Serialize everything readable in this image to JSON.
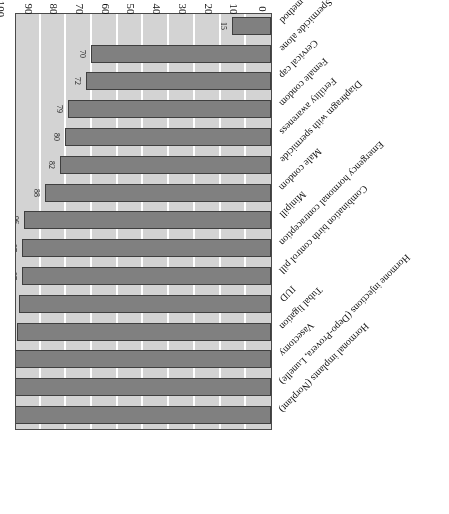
{
  "chart_data": {
    "type": "bar",
    "orientation": "horizontal",
    "title": "",
    "subtitle": "",
    "xlabel": "",
    "ylabel": "",
    "xlim": [
      0,
      100
    ],
    "x_ticks": [
      0,
      10,
      20,
      30,
      40,
      50,
      60,
      70,
      80,
      90,
      100
    ],
    "x_tick_labels": [
      "0",
      "10",
      "20",
      "30",
      "40",
      "50",
      "60",
      "70",
      "80",
      "90",
      "100"
    ],
    "grid": "vertical-white-gridlines",
    "legend": "none",
    "rotation_note": "entire figure printed rotated 180 degrees",
    "categories": [
      "Hormonal implants (Norplant)",
      "Hormone injections (Depo-Provera, Lunelle)",
      "Vasectomy",
      "Tubal ligation",
      "IUD",
      "Combination birth control pill",
      "Emergency hormonal contraception",
      "Minipill",
      "Male condom",
      "Diaphragm with spermicide",
      "Fertility awareness",
      "Female condom",
      "Cervical cap",
      "Spermicide alone",
      "No method"
    ],
    "values": [
      99.9,
      99.8,
      99.6,
      99,
      98,
      97,
      97,
      96,
      88,
      82,
      80,
      79,
      72,
      70,
      15
    ],
    "value_labels": [
      "99.9",
      "99.8",
      "99.6",
      "99",
      "98",
      "97",
      "97",
      "96",
      "88",
      "82",
      "80",
      "79",
      "72",
      "70",
      "15"
    ],
    "colors": {
      "bar_fill": "#808080",
      "bar_border": "#3f3f3f",
      "plot_background": "#d3d3d3",
      "gridline": "#ffffff",
      "axis_line": "#4a4a4a",
      "text": "#111111",
      "page_background": "#ffffff"
    }
  }
}
